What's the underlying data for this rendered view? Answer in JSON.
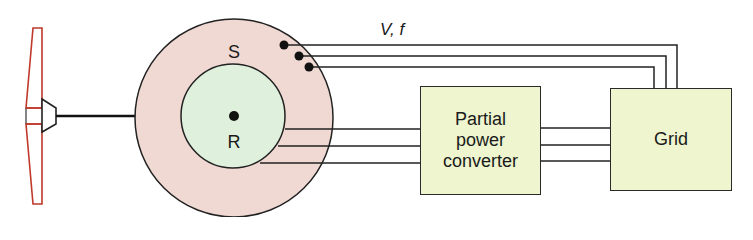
{
  "diagram": {
    "labels": {
      "stator": "S",
      "rotor": "R",
      "stator_output": "V, f",
      "converter": "Partial power converter",
      "converter_lines": [
        "Partial",
        "power",
        "converter"
      ],
      "grid": "Grid"
    },
    "nodes": [
      {
        "id": "turbine",
        "label": ""
      },
      {
        "id": "stator",
        "label": "S"
      },
      {
        "id": "rotor",
        "label": "R"
      },
      {
        "id": "converter",
        "label": "Partial power converter"
      },
      {
        "id": "grid",
        "label": "Grid"
      }
    ],
    "edges": [
      {
        "from": "turbine",
        "to": "rotor",
        "type": "shaft"
      },
      {
        "from": "stator",
        "to": "grid",
        "type": "3-phase",
        "label": "V, f"
      },
      {
        "from": "rotor",
        "to": "converter",
        "type": "3-phase"
      },
      {
        "from": "converter",
        "to": "grid",
        "type": "3-phase"
      }
    ],
    "colors": {
      "stator_fill": "#f0d9d2",
      "rotor_fill": "#dff0dc",
      "box_fill": "#eef5cf",
      "blade_stroke": "#c0392b",
      "line": "#1a1a1a"
    }
  }
}
